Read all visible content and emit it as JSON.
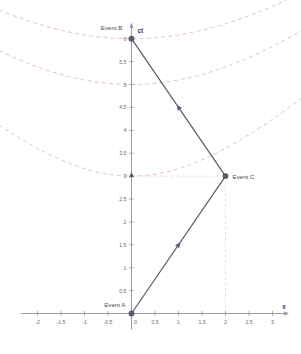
{
  "chart_data": {
    "type": "scatter",
    "title": "",
    "subtitle": "",
    "xlabel": "x",
    "ylabel": "ct",
    "xlim": [
      -2.35,
      3.35
    ],
    "ylim": [
      -0.35,
      6.35
    ],
    "grid": false,
    "legend": null,
    "x_ticks": [
      "-2",
      "-1.5",
      "-1",
      "-0.5",
      "0",
      "0.5",
      "1",
      "1.5",
      "2",
      "2.5",
      "3"
    ],
    "x_tick_values": [
      -2,
      -1.5,
      -1,
      -0.5,
      0,
      0.5,
      1,
      1.5,
      2,
      2.5,
      3
    ],
    "y_ticks": [
      "0.5",
      "1",
      "1.5",
      "2",
      "2.5",
      "3",
      "3.5",
      "4",
      "4.5",
      "5",
      "5.5",
      "6"
    ],
    "y_tick_values": [
      0.5,
      1,
      1.5,
      2,
      2.5,
      3,
      3.5,
      4,
      4.5,
      5,
      5.5,
      6
    ],
    "points": [
      {
        "label": "Event A",
        "x": 0,
        "y": 0,
        "label_pos": "above-left"
      },
      {
        "label": "Event B",
        "x": 0,
        "y": 6,
        "label_pos": "left"
      },
      {
        "label": "Event C",
        "x": 2,
        "y": 3,
        "label_pos": "right"
      }
    ],
    "series": [
      {
        "name": "worldline-outbound",
        "from": "Event A",
        "to": "Event C",
        "x": [
          0,
          2
        ],
        "values": [
          0,
          3
        ],
        "arrow_at": {
          "x": 1,
          "y": 1.5,
          "direction": "up-right"
        }
      },
      {
        "name": "worldline-return",
        "from": "Event C",
        "to": "Event B",
        "x": [
          2,
          0
        ],
        "values": [
          3,
          6
        ],
        "arrow_at": {
          "x": 1,
          "y": 4.5,
          "direction": "up-left"
        }
      }
    ],
    "hyperbolas": [
      {
        "name": "invariant-hyperbola-ct3",
        "vertex_ct": 3
      },
      {
        "name": "invariant-hyperbola-ct5",
        "vertex_ct": 5
      },
      {
        "name": "invariant-hyperbola-ct6",
        "vertex_ct": 6
      }
    ],
    "guides": [
      {
        "name": "guide-horizontal-eventC",
        "from": [
          0,
          3
        ],
        "to": [
          2,
          3
        ]
      },
      {
        "name": "guide-vertical-eventC",
        "from": [
          2,
          0
        ],
        "to": [
          2,
          3
        ]
      }
    ],
    "colors": {
      "axis": "#9a9aa8",
      "worldline": "#5a5a6e",
      "hyperbola": "#e3b9b9",
      "guide": "#e8d8d8",
      "tick_text": "#6b6b6b",
      "axis_name": "#3b3b6b",
      "point_label": "#4a4a4a"
    }
  },
  "labels": {
    "event_a": "Event A",
    "event_b": "Event B",
    "event_c": "Event C",
    "x_axis": "x",
    "ct_axis": "ct"
  }
}
